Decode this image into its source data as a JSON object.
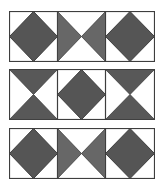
{
  "figure": {
    "colors": {
      "border": "#3e3e3e",
      "diamond": "#555555",
      "triangle_light": "#676767",
      "triangle_dark": "#585858",
      "background": "#ffffff"
    },
    "rows": [
      {
        "top": 11,
        "cells": [
          "diamond",
          "hourglass-horizontal",
          "diamond"
        ]
      },
      {
        "top": 69,
        "cells": [
          "hourglass-vertical",
          "diamond",
          "hourglass-vertical"
        ]
      },
      {
        "top": 128,
        "cells": [
          "diamond",
          "hourglass-horizontal",
          "diamond"
        ]
      }
    ]
  }
}
